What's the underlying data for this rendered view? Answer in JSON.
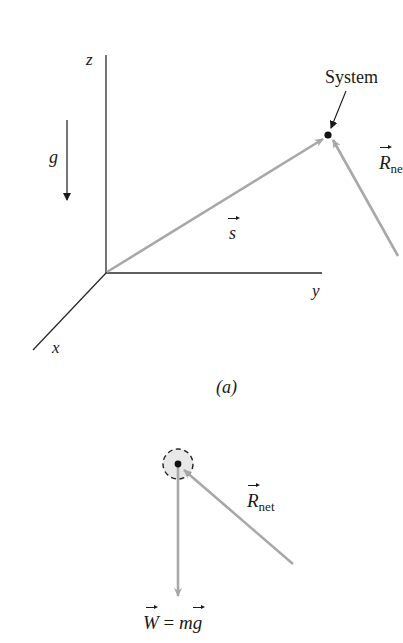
{
  "figure_a": {
    "axes": {
      "z_label": "z",
      "y_label": "y",
      "x_label": "x"
    },
    "gravity_label": "g",
    "system_label": "System",
    "displacement_label": "s",
    "rnet_label": "R",
    "rnet_sub": "ne",
    "caption": "(a)"
  },
  "figure_b": {
    "rnet_label": "R",
    "rnet_sub": "net",
    "weight_label_w": "W",
    "weight_label_eq": "=",
    "weight_label_m": "m",
    "weight_label_g": "g"
  },
  "colors": {
    "axis": "#2a2a2a",
    "vector_gray": "#a8a8a8",
    "dot": "#111111",
    "circle_fill": "#e8e8e8"
  }
}
